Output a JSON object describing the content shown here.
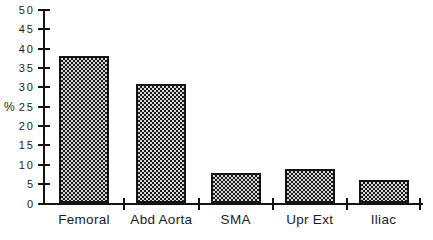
{
  "chart_data": {
    "type": "bar",
    "title": "",
    "xlabel": "",
    "ylabel": "%",
    "categories": [
      "Femoral",
      "Abd Aorta",
      "SMA",
      "Upr Ext",
      "Iliac"
    ],
    "values": [
      38,
      31,
      8,
      9,
      6
    ],
    "ylim": [
      0,
      50
    ],
    "ytick_step": 5,
    "yticks": [
      0,
      5,
      10,
      15,
      20,
      25,
      30,
      35,
      40,
      45,
      50
    ],
    "grid": false,
    "legend": "none",
    "bar_fill_pattern": "checkerboard-dither",
    "bar_color_dark": "#1b1b1b",
    "bar_color_light": "#d6d6d6",
    "axis_color": "#141414",
    "text_color": "#1c1c1c",
    "background_color": "#ffffff"
  }
}
